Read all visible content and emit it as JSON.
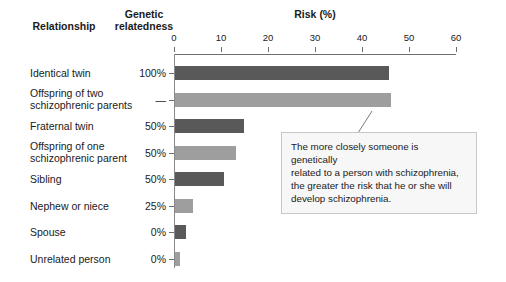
{
  "headers": {
    "relationship": "Relationship",
    "genetic_relatedness": "Genetic\nrelatedness",
    "genetic_relatedness_line1": "Genetic",
    "genetic_relatedness_line2": "relatedness",
    "risk": "Risk (%)"
  },
  "axis": {
    "label": "Risk (%)",
    "ticks": [
      "0",
      "10",
      "20",
      "30",
      "40",
      "50",
      "60"
    ],
    "min": 0,
    "max": 60,
    "step": 10
  },
  "colors": {
    "bar_dark": "#595959",
    "bar_light": "#9e9e9e",
    "axis": "#6e6e6e",
    "callout_bg": "#f7f7f7",
    "callout_border": "#c8c8c8",
    "text": "#1a1a1a"
  },
  "rows": [
    {
      "label": "Identical twin",
      "label_line1": "Identical twin",
      "label_line2": "",
      "relatedness": "100%",
      "risk": 45.5,
      "shade": "dark"
    },
    {
      "label": "Offspring of two schizophrenic parents",
      "label_line1": "Offspring of two",
      "label_line2": "schizophrenic parents",
      "relatedness": "—",
      "risk": 46.0,
      "shade": "light"
    },
    {
      "label": "Fraternal twin",
      "label_line1": "Fraternal twin",
      "label_line2": "",
      "relatedness": "50%",
      "risk": 14.7,
      "shade": "dark"
    },
    {
      "label": "Offspring of one schizophrenic parent",
      "label_line1": "Offspring of one",
      "label_line2": "schizophrenic parent",
      "relatedness": "50%",
      "risk": 13.0,
      "shade": "light"
    },
    {
      "label": "Sibling",
      "label_line1": "Sibling",
      "label_line2": "",
      "relatedness": "50%",
      "risk": 10.4,
      "shade": "dark"
    },
    {
      "label": "Nephew or niece",
      "label_line1": "Nephew or niece",
      "label_line2": "",
      "relatedness": "25%",
      "risk": 3.8,
      "shade": "light"
    },
    {
      "label": "Spouse",
      "label_line1": "Spouse",
      "label_line2": "",
      "relatedness": "0%",
      "risk": 2.3,
      "shade": "dark"
    },
    {
      "label": "Unrelated person",
      "label_line1": "Unrelated person",
      "label_line2": "",
      "relatedness": "0%",
      "risk": 1.0,
      "shade": "light"
    }
  ],
  "callout": {
    "text": "The more closely someone is genetically related to a person with schizophrenia, the greater the risk that he or she will develop schizophrenia.",
    "line1": "The more closely someone is genetically",
    "line2": "related to a person with schizophrenia,",
    "line3": "the greater the risk that he or she will",
    "line4": "develop schizophrenia."
  },
  "chart_data": {
    "type": "bar",
    "orientation": "horizontal",
    "title": "",
    "xlabel": "Risk (%)",
    "ylabel": "Relationship",
    "xlim": [
      0,
      60
    ],
    "xticks": [
      0,
      10,
      20,
      30,
      40,
      50,
      60
    ],
    "grid": false,
    "legend": "none",
    "categories": [
      "Identical twin",
      "Offspring of two schizophrenic parents",
      "Fraternal twin",
      "Offspring of one schizophrenic parent",
      "Sibling",
      "Nephew or niece",
      "Spouse",
      "Unrelated person"
    ],
    "values": [
      45.5,
      46.0,
      14.7,
      13.0,
      10.4,
      3.8,
      2.3,
      1.0
    ],
    "secondary_column": {
      "name": "Genetic relatedness",
      "values": [
        "100%",
        "—",
        "50%",
        "50%",
        "50%",
        "25%",
        "0%",
        "0%"
      ]
    },
    "annotations": [
      "The more closely someone is genetically related to a person with schizophrenia, the greater the risk that he or she will develop schizophrenia."
    ]
  }
}
